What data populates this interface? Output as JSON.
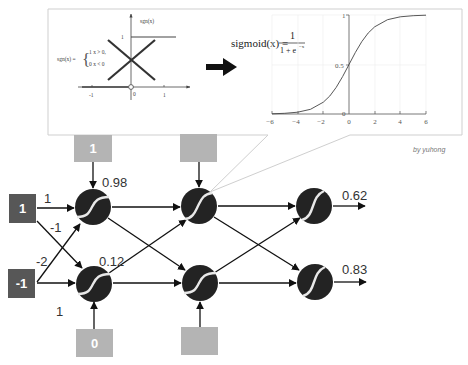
{
  "panel": {
    "sgn": {
      "formula_lhs": "sgn(x) =",
      "brace": "{",
      "case1": "1    x > 0,",
      "case2": "0    x < 0",
      "axis_label": "sgn(x)",
      "y_tick": "1",
      "x_ticks": [
        "-1",
        "0",
        "1"
      ]
    },
    "sigmoid": {
      "formula_lhs": "sigmoid(x) =",
      "numerator": "1",
      "denominator": "1 + e",
      "exponent": "−x",
      "y_ticks": [
        "1",
        "0.5",
        "0"
      ],
      "x_ticks": [
        "−6",
        "−4",
        "−2",
        "0",
        "2",
        "4",
        "6"
      ]
    },
    "credit": "by yuhong"
  },
  "network": {
    "inputs": [
      {
        "value": "1"
      },
      {
        "value": "-1"
      }
    ],
    "weights": {
      "in1_to_h1": "1",
      "in1_to_h2": "-1",
      "in2_to_h1": "-2",
      "in2_to_h2": "1"
    },
    "layer1": {
      "biases": [
        "1",
        "0"
      ],
      "activations": [
        "0.98",
        "0.12"
      ]
    },
    "layer2": {
      "biases": [
        "",
        ""
      ]
    },
    "outputs": [
      "0.62",
      "0.83"
    ],
    "colors": {
      "input_box": "#575757",
      "bias_box": "#b4b4b4",
      "neuron": "#232323",
      "arrow": "#111111",
      "panel_border": "#cfcfcf"
    }
  }
}
